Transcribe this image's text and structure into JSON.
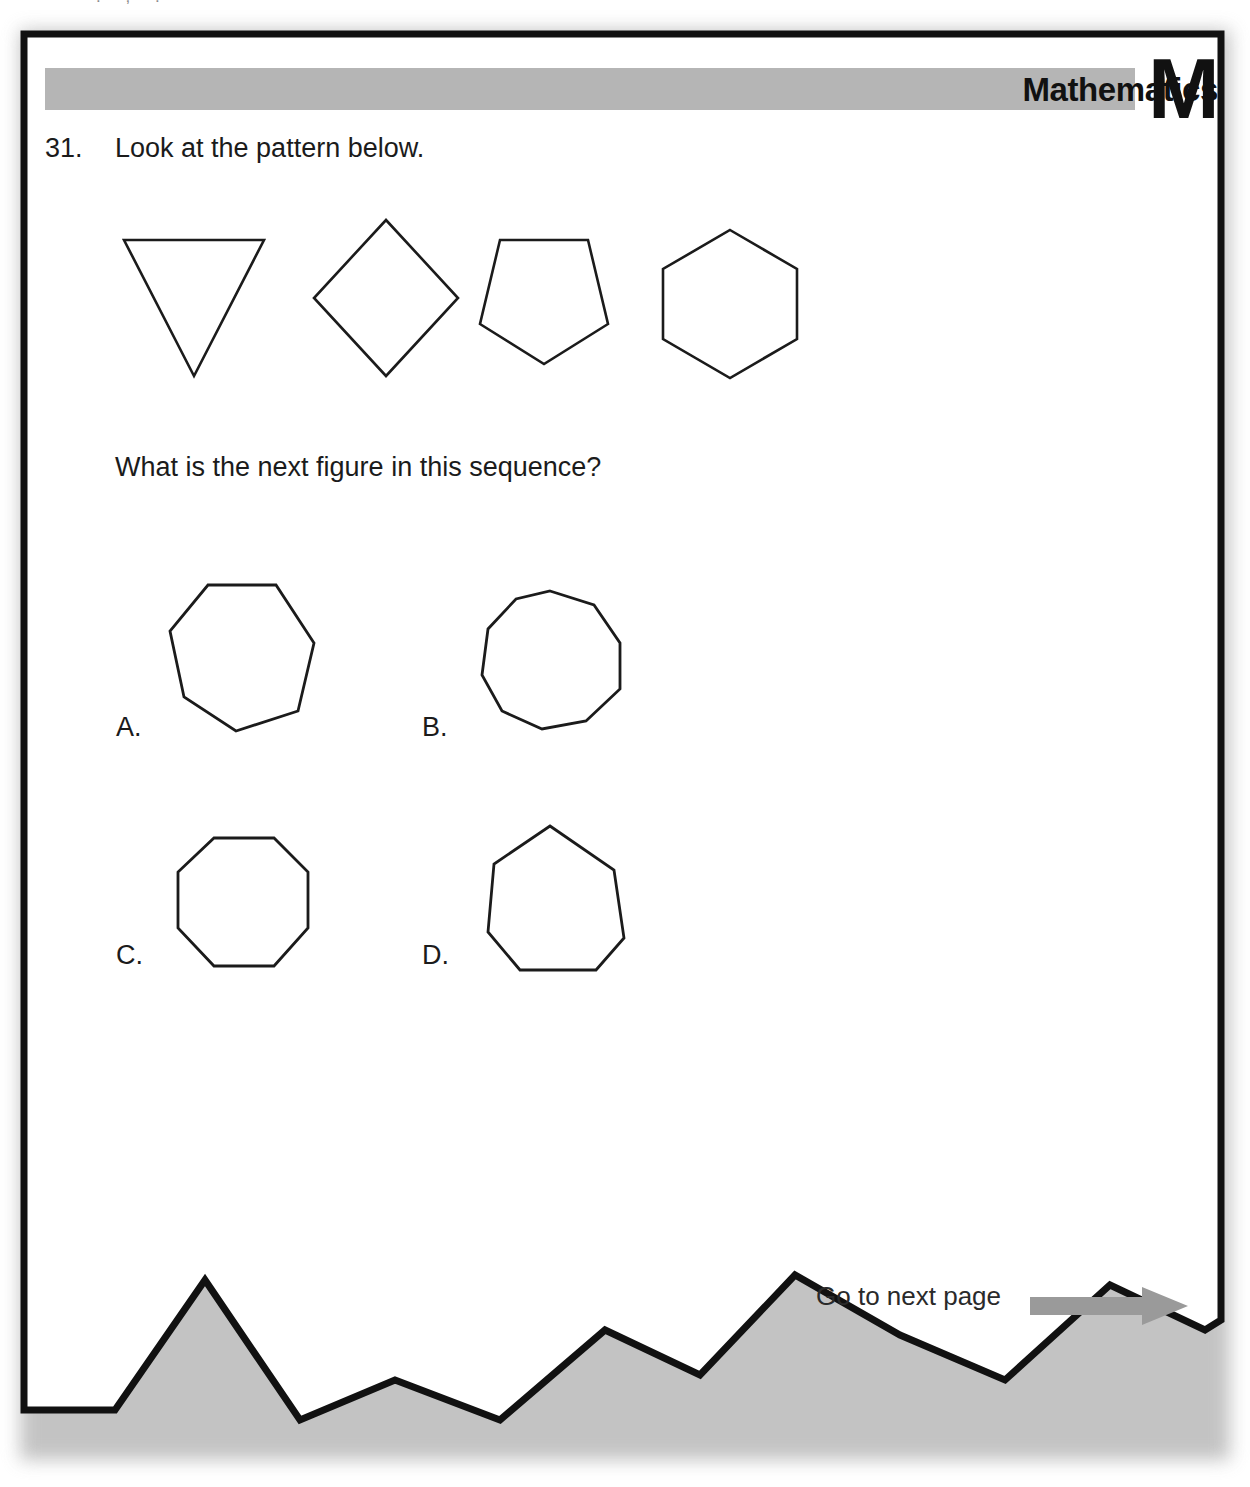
{
  "page": {
    "top_crumb": ". , ."
  },
  "header": {
    "band_color": "#b5b5b5",
    "subject": "Mathematics",
    "subject_letter": "M"
  },
  "question": {
    "number": "31.",
    "stem": "Look at the pattern below.",
    "prompt": "What is the next figure in this sequence?",
    "sequence": [
      {
        "name": "triangle",
        "sides": 3,
        "label": "triangle"
      },
      {
        "name": "square",
        "sides": 4,
        "label": "square"
      },
      {
        "name": "pentagon",
        "sides": 5,
        "label": "pentagon"
      },
      {
        "name": "hexagon",
        "sides": 6,
        "label": "hexagon"
      }
    ],
    "options": [
      {
        "letter": "A.",
        "name": "heptagon",
        "sides": 7
      },
      {
        "letter": "B.",
        "name": "nonagon",
        "sides": 9
      },
      {
        "letter": "C.",
        "name": "octagon",
        "sides": 8
      },
      {
        "letter": "D.",
        "name": "heptagon",
        "sides": 7
      }
    ]
  },
  "footer": {
    "next_page_text": "Go to next page",
    "arrow_color": "#9a9a9a"
  },
  "colors": {
    "ink": "#1b1b1b",
    "band": "#b5b5b5",
    "paper": "#ffffff",
    "shadow": "#b9b9b9"
  }
}
